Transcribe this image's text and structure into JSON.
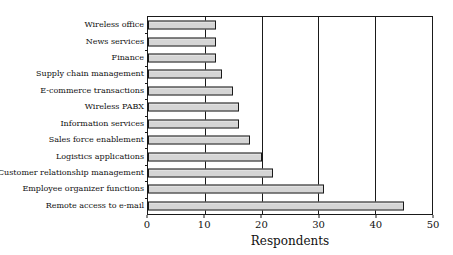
{
  "chart_data": {
    "type": "bar",
    "orientation": "horizontal",
    "title": "",
    "xlabel": "Respondents",
    "ylabel": "",
    "categories": [
      "Wireless office",
      "News services",
      "Finance",
      "Supply chain management",
      "E-commerce transactions",
      "Wireless PABX",
      "Information services",
      "Sales force enablement",
      "Logistics applications",
      "Customer relationship management",
      "Employee organizer functions",
      "Remote access to e-mail"
    ],
    "values": [
      12,
      12,
      12,
      13,
      15,
      16,
      16,
      18,
      20,
      22,
      31,
      45
    ],
    "xlim": [
      0,
      50
    ],
    "xticks": [
      0,
      10,
      20,
      30,
      40,
      50
    ],
    "grid": "vertical",
    "legend": "none",
    "colors": {
      "bar_fill": "#d5d5d5",
      "bar_border": "#1a1a1a",
      "axis": "#1a1a1a",
      "background": "#ffffff"
    }
  }
}
